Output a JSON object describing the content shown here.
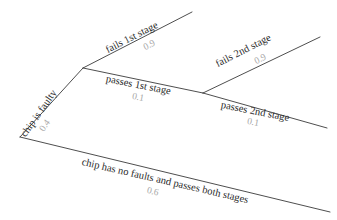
{
  "diagram": {
    "type": "probability-tree",
    "title": "",
    "background_color": "#ffffff",
    "line_color": "#3a3a3a",
    "label_color": "#2b2b2b",
    "probability_color": "#a8a8a8",
    "nodes": [
      {
        "id": "root",
        "x": 20,
        "y": 137
      },
      {
        "id": "faulty",
        "x": 83,
        "y": 68
      },
      {
        "id": "fail-1st-end",
        "x": 192,
        "y": 12
      },
      {
        "id": "pass-1st",
        "x": 203,
        "y": 93
      },
      {
        "id": "fail-2nd-end",
        "x": 320,
        "y": 37
      },
      {
        "id": "pass-2nd-end",
        "x": 327,
        "y": 128
      },
      {
        "id": "no-faults-end",
        "x": 330,
        "y": 212
      }
    ],
    "branches": [
      {
        "id": "chip-is-faulty",
        "label": "chip is faulty",
        "probability": "0.4",
        "from": "root",
        "to": "faulty"
      },
      {
        "id": "fails-1st-stage",
        "label": "fails 1st stage",
        "probability": "0.9",
        "from": "faulty",
        "to": "fail-1st-end"
      },
      {
        "id": "passes-1st-stage",
        "label": "passes 1st stage",
        "probability": "0.1",
        "from": "faulty",
        "to": "pass-1st"
      },
      {
        "id": "fails-2nd-stage",
        "label": "fails 2nd stage",
        "probability": "0.9",
        "from": "pass-1st",
        "to": "fail-2nd-end"
      },
      {
        "id": "passes-2nd-stage",
        "label": "passes 2nd stage",
        "probability": "0.1",
        "from": "pass-1st",
        "to": "pass-2nd-end"
      },
      {
        "id": "chip-has-no-faults",
        "label": "chip has no faults and passes both stages",
        "probability": "0.6",
        "from": "root",
        "to": "no-faults-end"
      }
    ]
  }
}
